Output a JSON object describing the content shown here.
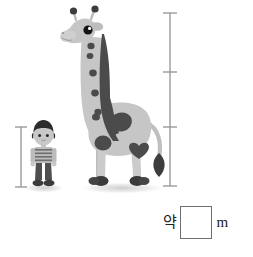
{
  "page": {
    "background_color": "#ffffff",
    "width": 253,
    "height": 257
  },
  "illustration": {
    "boy": {
      "name": "boy-figure",
      "hair_color": "#2b2b2b",
      "skin_color": "#c8c8c8",
      "shirt_color": "#b9b9b9",
      "shirt_stripe_color": "#6f6f6f",
      "pants_color": "#4f4f4f",
      "shoe_color": "#3a3a3a",
      "shadow_color": "#d8d8d8"
    },
    "giraffe": {
      "name": "giraffe-figure",
      "body_color": "#c6c6c6",
      "body_shade_color": "#b2b2b2",
      "spot_color": "#4b4b4b",
      "mane_color": "#4b4b4b",
      "hoof_color": "#3a3a3a",
      "eye_color": "#141414",
      "tail_tuft_color": "#3d3d3d",
      "shadow_color": "#dcdcdc"
    }
  },
  "rulers": {
    "boy_ruler": {
      "name": "boy-height-ruler",
      "color": "#9a9a9a",
      "tick_count": 0,
      "top_y": 127,
      "bottom_y": 187
    },
    "giraffe_ruler": {
      "name": "giraffe-height-ruler",
      "color": "#9a9a9a",
      "tick_count": 2,
      "top_y": 13,
      "bottom_y": 186,
      "tick_positions_y": [
        72,
        127
      ]
    }
  },
  "answer": {
    "prefix_label": "약",
    "value": "",
    "placeholder": "",
    "unit_label": "m",
    "box_border_color": "#6e6e6e"
  }
}
